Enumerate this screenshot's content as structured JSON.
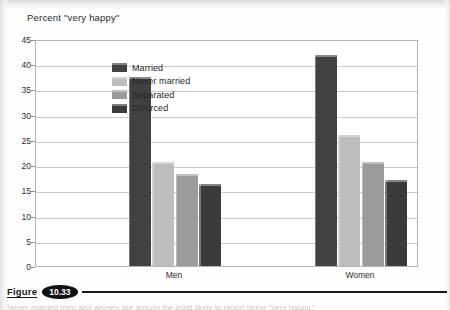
{
  "figure": {
    "word_label": "Figure",
    "number": "10.33",
    "caption_text": "Never-married men and women are among the least likely to report being \"very happy.\""
  },
  "chart_data": {
    "type": "bar",
    "title": "Percent \"very happy\"",
    "xlabel": "",
    "ylabel": "",
    "categories": [
      "Men",
      "Women"
    ],
    "series": [
      {
        "name": "Married",
        "values": [
          37.4,
          41.8
        ],
        "color": "#414141"
      },
      {
        "name": "Never married",
        "values": [
          20.7,
          26.0
        ],
        "color": "#bdbdbd"
      },
      {
        "name": "Separated",
        "values": [
          18.2,
          20.6
        ],
        "color": "#9b9b9b"
      },
      {
        "name": "Divorced",
        "values": [
          16.3,
          17.1
        ],
        "color": "#3b3b3b"
      }
    ],
    "ylim": [
      0,
      45
    ],
    "yticks": [
      0,
      5,
      10,
      15,
      20,
      25,
      30,
      35,
      40,
      45
    ],
    "ytick_labels": [
      "0",
      "5",
      "10",
      "15",
      "20",
      "25",
      "30",
      "35",
      "40",
      "45"
    ],
    "grid": true,
    "legend_position": "inside-upper-left"
  }
}
